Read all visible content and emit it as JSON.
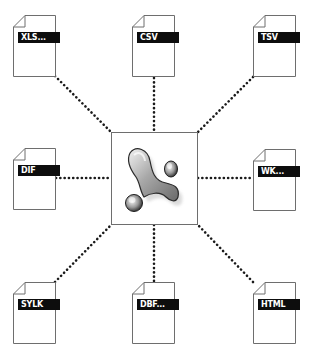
{
  "diagram": {
    "center": {
      "icon": "access-database-icon",
      "description": "Central application icon (stylized key/lizard shape)"
    },
    "documents": [
      {
        "id": "xls",
        "label": "XLS...",
        "position": "top-left",
        "icon": "document-icon"
      },
      {
        "id": "csv",
        "label": "CSV",
        "position": "top-center",
        "icon": "document-icon"
      },
      {
        "id": "tsv",
        "label": "TSV",
        "position": "top-right",
        "icon": "document-icon"
      },
      {
        "id": "dif",
        "label": "DIF",
        "position": "middle-left",
        "icon": "document-icon"
      },
      {
        "id": "wk",
        "label": "WK...",
        "position": "middle-right",
        "icon": "document-icon"
      },
      {
        "id": "sylk",
        "label": "SYLK",
        "position": "bottom-left",
        "icon": "document-icon"
      },
      {
        "id": "dbf",
        "label": "DBF...",
        "position": "bottom-center",
        "icon": "document-icon"
      },
      {
        "id": "html",
        "label": "HTML",
        "position": "bottom-right",
        "icon": "document-icon"
      }
    ],
    "connector_style": "dotted",
    "colors": {
      "background": "#ffffff",
      "outline": "#6e6e6e",
      "label_bg": "#0d0d0d",
      "label_text": "#ffffff",
      "connector": "#1a1a1a"
    }
  }
}
